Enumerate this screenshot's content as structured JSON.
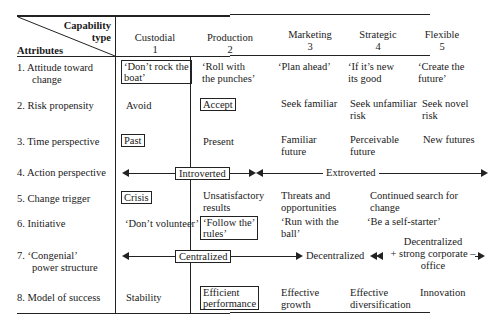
{
  "header": {
    "corner_top": "Capability",
    "corner_mid": "type",
    "corner_bottom": "Attributes",
    "columns": [
      {
        "name": "Custodial",
        "num": "1"
      },
      {
        "name": "Production",
        "num": "2"
      },
      {
        "name": "Marketing",
        "num": "3"
      },
      {
        "name": "Strategic",
        "num": "4"
      },
      {
        "name": "Flexible",
        "num": "5"
      }
    ]
  },
  "rows": [
    {
      "label_l1": "1.  Attitude toward",
      "label_l2": "change",
      "c1_l1": "‘Don’t rock the",
      "c1_l2": "boat’",
      "c2_l1": "‘Roll with",
      "c2_l2": "the punches’",
      "c3": "‘Plan ahead’",
      "c4_l1": "‘If it’s new",
      "c4_l2": "its good",
      "c5_l1": "‘Create the",
      "c5_l2": "future’"
    },
    {
      "label": "2.  Risk propensity",
      "c1": "Avoid",
      "c2": "Accept",
      "c3": "Seek familiar",
      "c4_l1": "Seek unfamiliar",
      "c4_l2": "risk",
      "c5_l1": "Seek novel",
      "c5_l2": "risk"
    },
    {
      "label": "3.  Time perspective",
      "c1": "Past",
      "c2": "Present",
      "c3_l1": "Familiar",
      "c3_l2": "future",
      "c4_l1": "Perceivable",
      "c4_l2": "future",
      "c5": "New futures"
    },
    {
      "label": "4.  Action perspective",
      "span1": "Introverted",
      "span2": "Extroverted"
    },
    {
      "label": "5.  Change trigger",
      "c1": "Crisis",
      "c2_l1": "Unsatisfactory",
      "c2_l2": "results",
      "c3_l1": "Threats and",
      "c3_l2": "opportunities",
      "c45_l1": "Continued search for",
      "c45_l2": "change"
    },
    {
      "label": "6.  Initiative",
      "c1": "‘Don’t volunteer’",
      "c2_l1": "‘Follow the’",
      "c2_l2": "rules’",
      "c3_l1": "‘Run with the",
      "c3_l2": "ball’",
      "c45": "‘Be a self-starter’"
    },
    {
      "label_l1": "7.  ‘Congenial’",
      "label_l2": "power structure",
      "span1": "Centralized",
      "span2": "Decentralized",
      "span3_l1": "Decentralized",
      "span3_l2": "+ strong corporate –",
      "span3_l3": "office"
    },
    {
      "label": "8.  Model of success",
      "c1": "Stability",
      "c2_l1": "Efficient",
      "c2_l2": "performance",
      "c3_l1": "Effective",
      "c3_l2": "growth",
      "c4_l1": "Effective",
      "c4_l2": "diversification",
      "c5": "Innovation"
    }
  ]
}
